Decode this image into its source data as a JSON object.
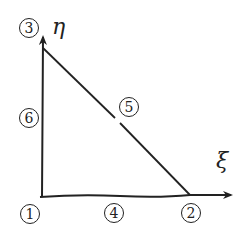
{
  "diagram": {
    "title": "",
    "colors": {
      "stroke": "#222222",
      "background": "#ffffff"
    },
    "axes": {
      "xi": {
        "label": "ξ",
        "name": "xi-axis"
      },
      "eta": {
        "label": "η",
        "name": "eta-axis"
      }
    },
    "nodes": [
      {
        "id": "1",
        "label": "1",
        "role": "corner",
        "location": "origin"
      },
      {
        "id": "2",
        "label": "2",
        "role": "corner",
        "location": "xi=1"
      },
      {
        "id": "3",
        "label": "3",
        "role": "corner",
        "location": "eta=1"
      },
      {
        "id": "4",
        "label": "4",
        "role": "mid-side",
        "location": "edge 1-2"
      },
      {
        "id": "5",
        "label": "5",
        "role": "mid-side",
        "location": "edge 2-3"
      },
      {
        "id": "6",
        "label": "6",
        "role": "mid-side",
        "location": "edge 3-1"
      }
    ],
    "edges": [
      {
        "from": "1",
        "to": "2"
      },
      {
        "from": "2",
        "to": "3"
      },
      {
        "from": "3",
        "to": "1"
      }
    ]
  }
}
